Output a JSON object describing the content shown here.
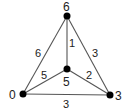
{
  "graph": {
    "nodes": [
      {
        "id": "top",
        "label": "6",
        "x": 67,
        "y": 16
      },
      {
        "id": "center",
        "label": "5",
        "x": 67,
        "y": 69
      },
      {
        "id": "left",
        "label": "0",
        "x": 23,
        "y": 94
      },
      {
        "id": "right",
        "label": "3",
        "x": 110,
        "y": 95
      }
    ],
    "edges": [
      {
        "from": "top",
        "to": "left",
        "weight": "6"
      },
      {
        "from": "top",
        "to": "right",
        "weight": "3"
      },
      {
        "from": "top",
        "to": "center",
        "weight": "1"
      },
      {
        "from": "center",
        "to": "left",
        "weight": "5"
      },
      {
        "from": "center",
        "to": "right",
        "weight": "2"
      },
      {
        "from": "left",
        "to": "right",
        "weight": "3"
      }
    ]
  }
}
